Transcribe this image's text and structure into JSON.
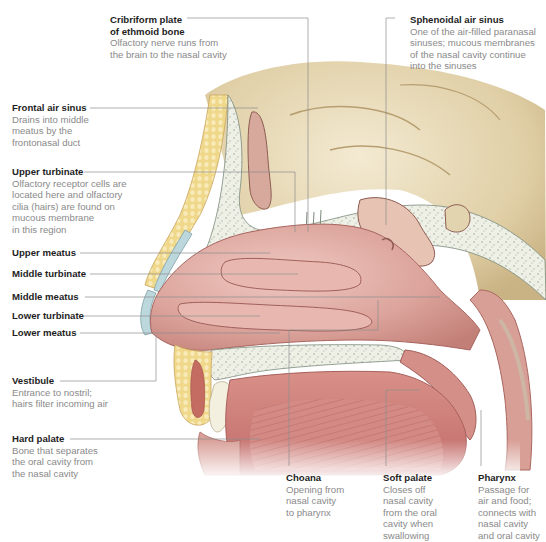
{
  "figure": {
    "colors": {
      "label_title": "#1e1e1e",
      "label_desc": "#8a8a8a",
      "leader_line": "#8c8c8c",
      "mucosa": "#d9a19a",
      "mucosa_dark": "#b8726c",
      "bone": "#eef0e6",
      "brain": "#e3d4b0",
      "fat": "#f1d98e",
      "cartilage": "#bcd8dc"
    }
  },
  "labels": {
    "cribriform": {
      "title_line1": "Cribriform plate",
      "title_line2": "of ethmoid bone",
      "desc": "Olfactory nerve runs from\nthe brain to the nasal cavity"
    },
    "sphenoidal": {
      "title": "Sphenoidal air sinus",
      "desc": "One of the air-filled paranasal\nsinuses; mucous membranes\nof the nasal cavity continue\ninto the sinuses"
    },
    "frontal": {
      "title": "Frontal air sinus",
      "desc": "Drains into middle\nmeatus by the\nfrontonasal duct"
    },
    "upper_turbinate": {
      "title": "Upper turbinate",
      "desc": "Olfactory receptor cells are\nlocated here and olfactory\ncilia (hairs) are found on\nmucous membrane\nin this region"
    },
    "upper_meatus": {
      "title": "Upper meatus"
    },
    "middle_turbinate": {
      "title": "Middle turbinate"
    },
    "middle_meatus": {
      "title": "Middle meatus"
    },
    "lower_turbinate": {
      "title": "Lower turbinate"
    },
    "lower_meatus": {
      "title": "Lower meatus"
    },
    "vestibule": {
      "title": "Vestibule",
      "desc": "Entrance to nostril;\nhairs filter incoming air"
    },
    "hard_palate": {
      "title": "Hard palate",
      "desc": "Bone that separates\nthe oral cavity from\nthe nasal cavity"
    },
    "choana": {
      "title": "Choana",
      "desc": "Opening from\nnasal cavity\nto pharynx"
    },
    "soft_palate": {
      "title": "Soft palate",
      "desc": "Closes off\nnasal cavity\nfrom the oral\ncavity when\nswallowing"
    },
    "pharynx": {
      "title": "Pharynx",
      "desc": "Passage for\nair and food;\nconnects with\nnasal cavity\nand oral cavity"
    }
  }
}
